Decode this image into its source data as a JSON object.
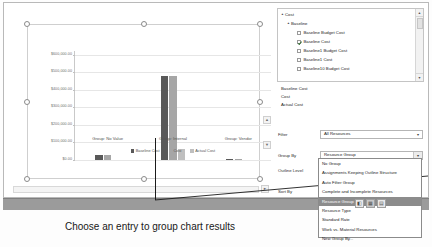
{
  "chart": {
    "selection_handles": 8,
    "legend": [
      {
        "label": "Baseline Cost",
        "color": "#595959"
      },
      {
        "label": "Cost",
        "color": "#a6a6a6"
      },
      {
        "label": "Actual Cost",
        "color": "#bfbfbf"
      }
    ]
  },
  "chart_data": {
    "type": "bar",
    "title": "",
    "xlabel": "",
    "ylabel": "",
    "categories": [
      "Group: No Value",
      "Group: Internal",
      "Group: Vendor"
    ],
    "ytick_labels": [
      "$600,000.00",
      "$500,000.00",
      "$400,000.00",
      "$300,000.00",
      "$200,000.00",
      "$100,000.00",
      "$0.00"
    ],
    "ytick_values": [
      600000,
      500000,
      400000,
      300000,
      200000,
      100000,
      0
    ],
    "ylim": [
      0,
      620000
    ],
    "grid": true,
    "legend_position": "bottom",
    "series": [
      {
        "name": "Baseline Cost",
        "color": "#595959",
        "values": [
          28000,
          480000,
          2500
        ]
      },
      {
        "name": "Cost",
        "color": "#a6a6a6",
        "values": [
          31000,
          478000,
          2500
        ]
      },
      {
        "name": "Actual Cost",
        "color": "#bfbfbf",
        "values": [
          0,
          62000,
          0
        ]
      }
    ]
  },
  "field_tree": {
    "rows": [
      {
        "indent": 0,
        "twisty": "4",
        "checkbox": null,
        "label": "Cost"
      },
      {
        "indent": 1,
        "twisty": "4",
        "checkbox": null,
        "label": "Baseline"
      },
      {
        "indent": 2,
        "twisty": "",
        "checkbox": "off",
        "label": "Baseline Budget Cost"
      },
      {
        "indent": 2,
        "twisty": "",
        "checkbox": "on",
        "label": "Baseline Cost"
      },
      {
        "indent": 2,
        "twisty": "",
        "checkbox": "off",
        "label": "Baseline1 Budget Cost"
      },
      {
        "indent": 2,
        "twisty": "",
        "checkbox": "off",
        "label": "Baseline1 Cost"
      },
      {
        "indent": 2,
        "twisty": "",
        "checkbox": "off",
        "label": "Baseline10 Budget Cost"
      }
    ],
    "scroll_up": "▲",
    "scroll_down": "▼"
  },
  "selected_fields": [
    "Baseline Cost",
    "Cost",
    "Actual Cost"
  ],
  "form": {
    "filter_label": "Filter",
    "filter_value": "All Resources",
    "group_by_label": "Group By",
    "group_by_value": "Resource Group",
    "outline_level_label": "Outline Level",
    "sort_by_label": "Sort By",
    "dropdown_arrow": "▼"
  },
  "dropdown": {
    "items": [
      {
        "label": "No Group",
        "selected": false
      },
      {
        "label": "Assignments Keeping Outline Structure",
        "selected": false
      },
      {
        "label": "Auto Filter Group",
        "selected": false
      },
      {
        "label": "Complete and Incomplete Resources",
        "selected": false
      },
      {
        "label": "Resource Group",
        "selected": true
      },
      {
        "label": "Resource Type",
        "selected": false
      },
      {
        "label": "Standard Rate",
        "selected": false
      },
      {
        "label": "Work vs. Material Resources",
        "selected": false
      },
      {
        "label": "New Group By...",
        "selected": false
      }
    ]
  },
  "statusbar": {
    "icons": [
      "chart-view-icon",
      "grid-view-icon",
      "table-view-icon"
    ]
  },
  "caption": {
    "text": "Choose an entry to group chart results"
  },
  "scroll": {
    "up_arrow": "▲",
    "down_arrow": "▼",
    "right_arrow": "►"
  }
}
